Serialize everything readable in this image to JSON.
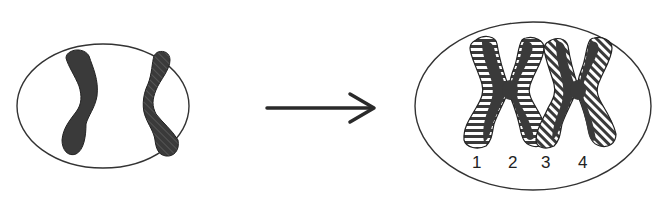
{
  "diagram": {
    "type": "chromosome-replication",
    "colors": {
      "background": "#ffffff",
      "outline": "#333333",
      "chromosome_fill": "#3a3a3a",
      "hatch": "#ffffff",
      "arrow": "#2a2a2a"
    },
    "left_cell": {
      "description": "cell with two unreplicated chromosomes",
      "chromosomes": [
        {
          "id": "left",
          "pattern": "solid"
        },
        {
          "id": "right",
          "pattern": "diagonal-hatched"
        }
      ]
    },
    "arrow": {
      "direction": "right"
    },
    "right_cell": {
      "description": "cell with two replicated chromosomes (sister chromatids)",
      "chromatid_labels": [
        "1",
        "2",
        "3",
        "4"
      ],
      "chromosomes": [
        {
          "id": "A",
          "chromatids": [
            "1",
            "2"
          ],
          "pattern": "horizontal-hatched"
        },
        {
          "id": "B",
          "chromatids": [
            "3",
            "4"
          ],
          "pattern": "diagonal-hatched"
        }
      ]
    }
  }
}
